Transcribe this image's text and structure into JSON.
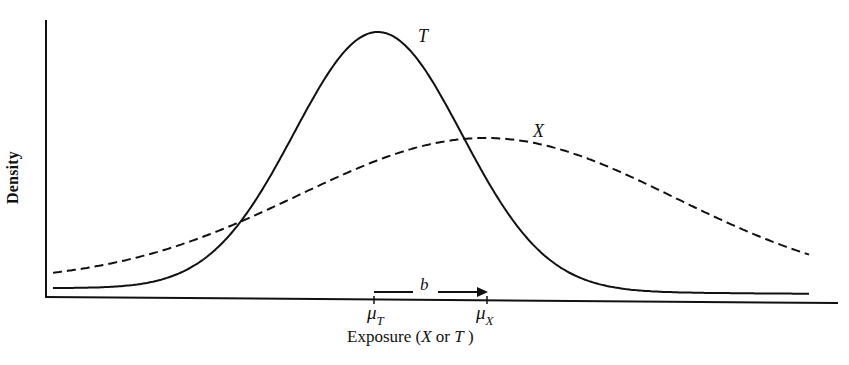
{
  "chart_data": {
    "type": "line",
    "title": "",
    "xlabel": "Exposure (X or T )",
    "xlabel_parts": {
      "prefix": "Exposure (",
      "var1": "X",
      "mid": " or ",
      "var2": "T",
      "suffix": " )"
    },
    "ylabel": "Density",
    "grid": false,
    "legend": "none (curves labeled inline)",
    "axis_ticks": {
      "x": [
        {
          "label": "μ_T",
          "symbol": "μ",
          "subscript": "T",
          "pixel_x": 373
        },
        {
          "label": "μ_X",
          "symbol": "μ",
          "subscript": "X",
          "pixel_x": 487
        }
      ],
      "y": []
    },
    "annotations": [
      {
        "text": "b",
        "type": "arrow",
        "from": "μ_T",
        "to": "μ_X",
        "meaning": "bias = μ_X − μ_T"
      }
    ],
    "series": [
      {
        "name": "T",
        "label": "T",
        "style": "solid",
        "distribution": "normal",
        "mean_pixel_x": 378,
        "sd_pixels": 84,
        "peak_pixel_y": 32,
        "relative_peak_height": 1.0,
        "x_range_pixels": [
          53,
          810
        ],
        "color": "#111111"
      },
      {
        "name": "X",
        "label": "X",
        "style": "dashed",
        "distribution": "normal",
        "mean_pixel_x": 487,
        "sd_pixels": 188,
        "peak_pixel_y": 138,
        "relative_peak_height": 0.6,
        "x_range_pixels": [
          53,
          810
        ],
        "color": "#111111"
      }
    ],
    "plot_geometry": {
      "y_axis": {
        "x": 46,
        "top": 20,
        "bottom": 298
      },
      "x_axis": {
        "left": 46,
        "right": 838,
        "y_left": 297,
        "y_right": 303
      },
      "baseline_y": 297
    }
  },
  "labels": {
    "ylabel": "Density",
    "curve_T": "T",
    "curve_X": "X",
    "arrow_b": "b",
    "mu_symbol": "μ",
    "mu_T_sub": "T",
    "mu_X_sub": "X",
    "xlabel_prefix": "Exposure (",
    "xlabel_var1": "X",
    "xlabel_mid": " or ",
    "xlabel_var2": "T",
    "xlabel_suffix": " )"
  },
  "colors": {
    "ink": "#111111",
    "background": "#ffffff"
  }
}
